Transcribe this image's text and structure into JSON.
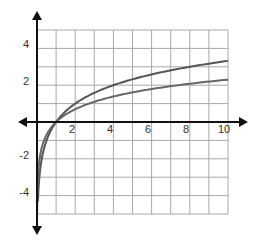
{
  "chart_data": {
    "type": "line",
    "title": "",
    "xlabel": "",
    "ylabel": "",
    "xlim": [
      0,
      10
    ],
    "ylim": [
      -5,
      5
    ],
    "grid": true,
    "x_ticks": [
      2,
      4,
      6,
      8,
      10
    ],
    "x_tick_labels": [
      "2",
      "4",
      "6",
      "8",
      "10"
    ],
    "y_ticks": [
      4,
      2,
      -2,
      -4
    ],
    "y_tick_labels": [
      "4",
      "2",
      "-2",
      "-4"
    ],
    "legend": null,
    "series": [
      {
        "name": "upper curve (log base 2 of x)",
        "color": "#555555",
        "x": [
          0.05,
          0.1,
          0.25,
          0.5,
          1,
          2,
          3,
          4,
          5,
          6,
          7,
          8,
          9,
          10
        ],
        "values": [
          -4.32,
          -3.32,
          -2.0,
          -1.0,
          0,
          1.0,
          1.58,
          2.0,
          2.32,
          2.58,
          2.81,
          3.0,
          3.17,
          3.32
        ]
      },
      {
        "name": "lower curve (natural log of x)",
        "color": "#666666",
        "x": [
          0.007,
          0.05,
          0.1,
          0.25,
          0.5,
          1,
          2,
          3,
          4,
          5,
          6,
          7,
          8,
          9,
          10
        ],
        "values": [
          -4.96,
          -3.0,
          -2.3,
          -1.39,
          -0.69,
          0,
          0.69,
          1.1,
          1.39,
          1.61,
          1.79,
          1.95,
          2.08,
          2.2,
          2.3
        ]
      }
    ],
    "colors": {
      "axis": "#111111",
      "grid": "#a8a8a8",
      "curve": "#555555"
    }
  }
}
